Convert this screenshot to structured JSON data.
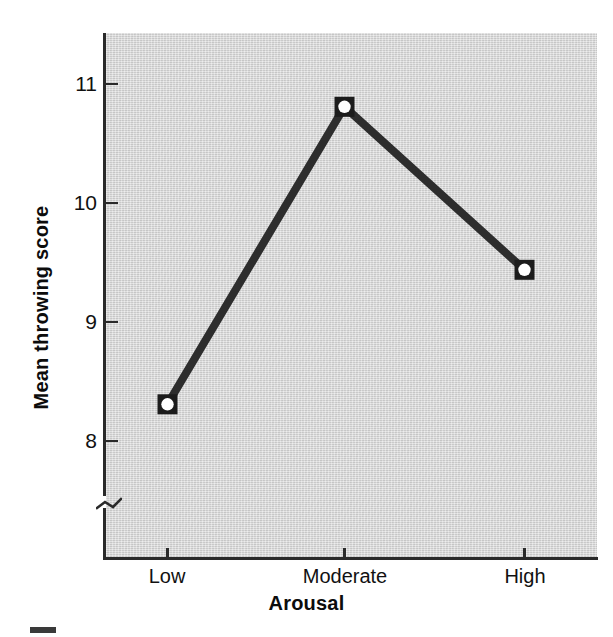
{
  "chart_data": {
    "type": "line",
    "title": "",
    "subtitle": "",
    "xlabel": "Arousal",
    "ylabel": "Mean throwing score",
    "categories": [
      "Low",
      "Moderate",
      "High"
    ],
    "values": [
      8.3,
      10.8,
      9.43
    ],
    "series": [
      {
        "name": "Mean throwing score",
        "values": [
          8.3,
          10.8,
          9.43
        ]
      }
    ],
    "ylim": [
      7.85,
      11.3
    ],
    "yticks": [
      8,
      9,
      10,
      11
    ],
    "ytick_labels": [
      "8",
      "9",
      "10",
      "11"
    ],
    "xtick_labels": [
      "Low",
      "Moderate",
      "High"
    ],
    "grid": false,
    "legend": false,
    "legend_position": "none",
    "axis_break": true,
    "annotations": [],
    "marker": "square-with-white-circle",
    "line_color": "#2d2d2d",
    "plot_background": "#d7d7d7"
  },
  "axes": {
    "y_title": "Mean throwing score",
    "x_title": "Arousal",
    "y_tick_labels": [
      "11",
      "10",
      "9",
      "8"
    ],
    "x_tick_labels": [
      "Low",
      "Moderate",
      "High"
    ]
  },
  "colors": {
    "line": "#2d2d2d",
    "marker_fill": "#ffffff",
    "marker_edge": "#1c1c1c",
    "panel": "#d7d7d7",
    "axis": "#2a2a2a",
    "text": "#111111"
  }
}
